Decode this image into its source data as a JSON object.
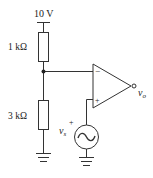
{
  "diagram": {
    "type": "circuit",
    "supply": {
      "label": "10 V"
    },
    "resistors": [
      {
        "id": "r1",
        "label": "1 kΩ"
      },
      {
        "id": "r2",
        "label": "3 kΩ"
      }
    ],
    "opamp": {
      "inverting_symbol": "−",
      "noninverting_symbol": "+"
    },
    "source": {
      "label_main": "v",
      "label_sub": "s",
      "polarity": "+"
    },
    "output": {
      "label_main": "v",
      "label_sub": "o"
    },
    "colors": {
      "stroke": "#333333",
      "background": "#ffffff"
    }
  }
}
